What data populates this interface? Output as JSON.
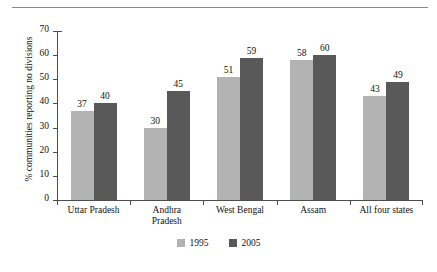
{
  "caption": {
    "text": "between 1995 and 2005"
  },
  "chart_data": {
    "type": "bar",
    "title": "",
    "xlabel": "",
    "ylabel": "% communities reporting no divisions",
    "ylim": [
      0,
      70
    ],
    "yticks": [
      0,
      10,
      20,
      30,
      40,
      50,
      60,
      70
    ],
    "grid": false,
    "legend_position": "bottom",
    "categories": [
      "Uttar Pradesh",
      "Andhra Pradesh",
      "West Bengal",
      "Assam",
      "All four states"
    ],
    "category_lines": [
      [
        "Uttar Pradesh"
      ],
      [
        "Andhra",
        "Pradesh"
      ],
      [
        "West Bengal"
      ],
      [
        "Assam"
      ],
      [
        "All four states"
      ]
    ],
    "series": [
      {
        "name": "1995",
        "color": "#b3b3b3",
        "values": [
          37,
          30,
          51,
          58,
          43
        ]
      },
      {
        "name": "2005",
        "color": "#595959",
        "values": [
          40,
          45,
          59,
          60,
          49
        ]
      }
    ]
  }
}
